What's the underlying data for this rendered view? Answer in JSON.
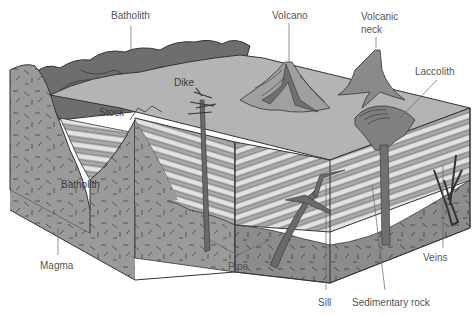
{
  "diagram": {
    "type": "geological block diagram",
    "colors": {
      "background": "#ffffff",
      "surface": "#b4b4b4",
      "mountains": "#6e6e6e",
      "igneous_rock": "#9a9a9a",
      "igneous_dark": "#8a8a8a",
      "sediment_light": "#e2e2e2",
      "sediment_dark": "#a8a8a8",
      "intrusion": "#707070",
      "outline": "#333333",
      "label_text": "#555555"
    }
  },
  "labels": {
    "batholith_top": "Batholith",
    "volcano": "Volcano",
    "volcanic_neck_line1": "Volcanic",
    "volcanic_neck_line2": "neck",
    "laccolith": "Laccolith",
    "dike": "Dike",
    "stock": "Stock",
    "batholith_inner": "Batholith",
    "magma": "Magma",
    "pipe": "Pipe",
    "sill": "Sill",
    "sedimentary_rock": "Sedimentary rock",
    "veins": "Veins"
  }
}
